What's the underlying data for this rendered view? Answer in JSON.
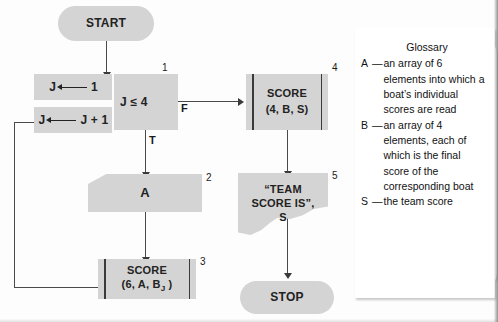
{
  "figure": {
    "type": "flowchart"
  },
  "nodes": {
    "start": {
      "label": "START",
      "shape": "terminal"
    },
    "init_j": {
      "lhs": "J",
      "arrow": "←",
      "rhs": "1",
      "shape": "process"
    },
    "incr_j": {
      "lhs": "J",
      "arrow": "←",
      "rhs": "J + 1",
      "shape": "process"
    },
    "decision": {
      "label": "J ≤ 4",
      "shape": "decision",
      "step": "1"
    },
    "read_a": {
      "label": "A",
      "shape": "input",
      "step": "2"
    },
    "score_boat": {
      "line1": "SCORE",
      "line2_pre": "(6, A, B",
      "line2_sub": "J",
      "line2_post": " )",
      "shape": "subroutine",
      "step": "3"
    },
    "score_team": {
      "line1": "SCORE",
      "line2": "(4, B, S)",
      "shape": "subroutine",
      "step": "4"
    },
    "output": {
      "line1": "“TEAM",
      "line2": "SCORE IS”,",
      "line3": "S",
      "shape": "output",
      "step": "5"
    },
    "stop": {
      "label": "STOP",
      "shape": "terminal"
    }
  },
  "branches": {
    "true_label": "T",
    "false_label": "F"
  },
  "glossary": {
    "title": "Glossary",
    "entries": [
      {
        "key": "A",
        "dash": "—",
        "definition": "an array of 6 elements into which a boat’s individual scores are read"
      },
      {
        "key": "B",
        "dash": "—",
        "definition": "an array of 4 elements, each of which is the final score of the corresponding boat"
      },
      {
        "key": "S",
        "dash": "—",
        "definition": "the team score"
      }
    ]
  },
  "colors": {
    "node_fill": "#d4d4d4",
    "line": "#4a4a4a",
    "text": "#1a1a1a",
    "background": "#fdfdfd"
  }
}
